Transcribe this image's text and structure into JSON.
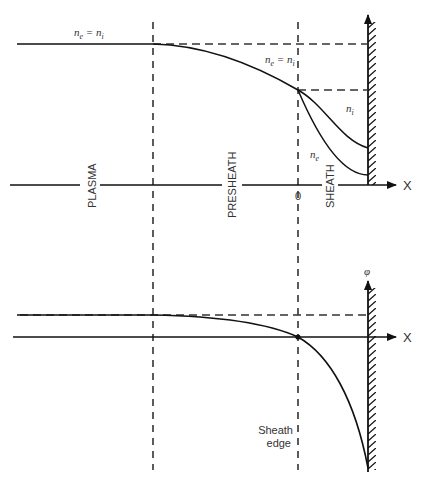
{
  "diagram": {
    "top_panel": {
      "region_labels": [
        "PLASMA",
        "PRESHEATH",
        "SHEATH"
      ],
      "origin_label": "0",
      "x_axis_label": "X",
      "curve_labels": {
        "plasma_equality": "n_e = n_i",
        "presheath_equality": "n_e = n_i",
        "ion_density": "n_i",
        "electron_density": "n_e"
      }
    },
    "bottom_panel": {
      "y_axis_label": "φ",
      "x_axis_label": "X",
      "sheath_edge_label_line1": "Sheath",
      "sheath_edge_label_line2": "edge"
    },
    "colors": {
      "line": "#111111",
      "dash": "#333333",
      "text": "#333333"
    }
  }
}
